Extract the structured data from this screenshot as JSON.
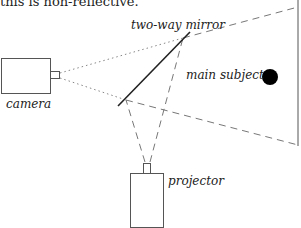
{
  "caption_fragment": "this is non-reflective.",
  "labels": {
    "mirror": "two-way mirror",
    "camera": "camera",
    "subject": "main subject",
    "projector": "projector"
  },
  "colors": {
    "line": "#222222",
    "dashed": "#777777",
    "subject": "#000000"
  }
}
